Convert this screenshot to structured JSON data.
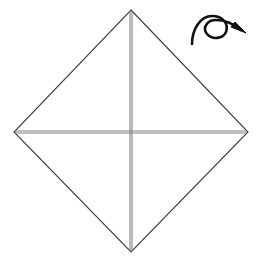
{
  "figure": {
    "title": "Origami fold diagram — square base with diagonal and quarter creases",
    "step_label": "",
    "background_color": "#ffffff",
    "width": 262,
    "height": 266
  },
  "colors": {
    "paper_edge": "#3b3b3b",
    "crease_line": "#808080",
    "crease_line_light": "#c2c2c2",
    "grid_line": "#c2c2c2",
    "arrow": "#111111",
    "paper_fill": "#ffffff"
  },
  "paper": {
    "shape_name": "diamond",
    "description": "Square sheet rotated 45 degrees, shown as a diamond",
    "vertices": {
      "top": {
        "x": 131,
        "y": 10
      },
      "right": {
        "x": 248,
        "y": 132
      },
      "bottom": {
        "x": 131,
        "y": 252
      },
      "left": {
        "x": 14,
        "y": 132
      }
    },
    "outline_points": "131,10 248,132 131,252 14,132",
    "edge_width": 1
  },
  "creases": {
    "vertical": {
      "name": "vertical-diagonal-crease",
      "x1": 131,
      "y1": 10,
      "x2": 131,
      "y2": 252,
      "style": "double-line"
    },
    "horizontal": {
      "name": "horizontal-diagonal-crease",
      "x1": 14,
      "y1": 132,
      "x2": 248,
      "y2": 132,
      "style": "double-line"
    },
    "double_line_offset": 2
  },
  "grid": {
    "name": "inner-square-creases",
    "description": "Faint quarter-fold crease square inscribed in the diamond",
    "left": 76,
    "right": 187,
    "top": 72,
    "bottom": 190,
    "lines": [
      {
        "name": "grid-line-top",
        "x1": 76,
        "y1": 72,
        "x2": 187,
        "y2": 72
      },
      {
        "name": "grid-line-bottom",
        "x1": 76,
        "y1": 190,
        "x2": 187,
        "y2": 190
      },
      {
        "name": "grid-line-left",
        "x1": 76,
        "y1": 72,
        "x2": 76,
        "y2": 190
      },
      {
        "name": "grid-line-right",
        "x1": 187,
        "y1": 72,
        "x2": 187,
        "y2": 190
      }
    ]
  },
  "arrow": {
    "name": "turn-over-arrow",
    "meaning": "Turn the model over",
    "color": "#111111",
    "stroke_width": 2.6,
    "path": "M 192 44 C 193 29, 202 17, 213 17 C 222 17, 228 24, 226 31 C 224 38, 214 40, 208 35 C 202 30, 205 21, 214 20 C 224 19, 234 24, 241 29",
    "head": {
      "points": "246,33 231,27 235,22",
      "tip": {
        "x": 246,
        "y": 33
      }
    }
  }
}
